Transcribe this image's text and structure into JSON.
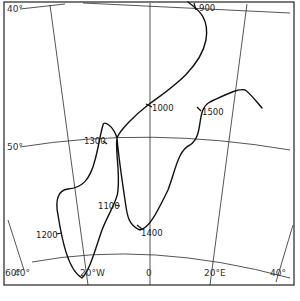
{
  "map": {
    "type": "track-map",
    "colors": {
      "line": "#111111",
      "grid": "#2a2a2a",
      "background": "#ffffff"
    },
    "latitude_labels": [
      {
        "id": "lat-40",
        "text": "40°"
      },
      {
        "id": "lat-50",
        "text": "50°"
      },
      {
        "id": "lat-60",
        "text": "60°"
      }
    ],
    "longitude_labels": [
      {
        "id": "lon-40w",
        "text": "40°"
      },
      {
        "id": "lon-20w",
        "text": "20°W"
      },
      {
        "id": "lon-0",
        "text": "0"
      },
      {
        "id": "lon-20e",
        "text": "20°E"
      },
      {
        "id": "lon-40e",
        "text": "40°"
      }
    ],
    "track_labels": [
      {
        "id": "t900",
        "text": "900"
      },
      {
        "id": "t1000",
        "text": "1000"
      },
      {
        "id": "t1100",
        "text": "1100"
      },
      {
        "id": "t1200",
        "text": "1200"
      },
      {
        "id": "t1300",
        "text": "1300"
      },
      {
        "id": "t1400",
        "text": "1400"
      },
      {
        "id": "t1500",
        "text": "1500"
      }
    ]
  }
}
